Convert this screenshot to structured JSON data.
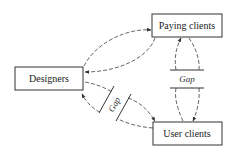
{
  "diagram": {
    "nodes": {
      "paying": {
        "label": "Paying clients"
      },
      "designers": {
        "label": "Designers"
      },
      "users": {
        "label": "User clients"
      }
    },
    "gaps": {
      "paying_users": {
        "label": "Gap"
      },
      "designers_users": {
        "label": "Gap"
      }
    },
    "edges": [
      {
        "from": "Designers",
        "to": "Paying clients",
        "style": "dashed"
      },
      {
        "from": "Paying clients",
        "to": "Designers",
        "style": "dashed"
      },
      {
        "from": "Paying clients",
        "to": "User clients",
        "style": "dashed",
        "blocked_by": "Gap"
      },
      {
        "from": "User clients",
        "to": "Paying clients",
        "style": "dashed",
        "blocked_by": "Gap"
      },
      {
        "from": "Designers",
        "to": "User clients",
        "style": "dashed",
        "blocked_by": "Gap"
      },
      {
        "from": "User clients",
        "to": "Designers",
        "style": "dashed",
        "blocked_by": "Gap"
      }
    ],
    "colors": {
      "stroke": "#333333",
      "background": "#ffffff"
    }
  }
}
